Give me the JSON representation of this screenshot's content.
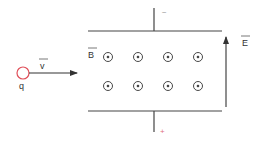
{
  "diagram": {
    "charge": {
      "label": "q",
      "color": "#e0505a"
    },
    "velocity": {
      "label": "v",
      "vector": true
    },
    "magnetic_field": {
      "label": "B",
      "vector": true,
      "direction": "out of page",
      "symbol_rows": 2,
      "symbol_cols": 4
    },
    "electric_field": {
      "label": "E",
      "vector": true,
      "direction": "up"
    },
    "top_plate": {
      "polarity": "−"
    },
    "bottom_plate": {
      "polarity": "+"
    },
    "colors": {
      "line": "#444444",
      "plus": "#e07080",
      "minus": "#999999"
    }
  }
}
